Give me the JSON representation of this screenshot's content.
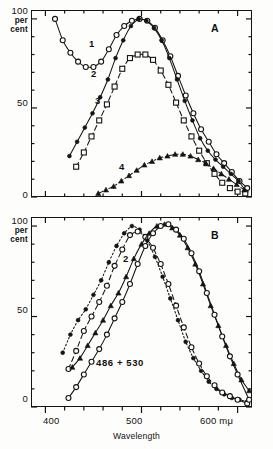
{
  "figure": {
    "width": 273,
    "height": 449,
    "background": "#fdfdfc",
    "ink": "#141414"
  },
  "axis": {
    "x_title": "Wavelength",
    "x_unit": "mμ",
    "x_ticks_major": [
      400,
      500,
      600
    ],
    "x_tick_labels": [
      "400",
      "500",
      "600 mμ"
    ],
    "x_minor_step": 20,
    "x_range": [
      385,
      615
    ],
    "y_ticks_major": [
      0,
      50,
      100
    ],
    "y_tick_labels": [
      "0",
      "50",
      "100"
    ],
    "y_unit_line1": "per",
    "y_unit_line2": "cent",
    "y_minor_step": 10,
    "y_range": [
      0,
      105
    ]
  },
  "panels": [
    {
      "id": "A",
      "label": "A"
    },
    {
      "id": "B",
      "label": "B",
      "annotation": "486 + 530"
    }
  ],
  "curve_labels_a": [
    "1",
    "2",
    "3",
    "4"
  ],
  "curve_labels_b": [
    "2"
  ],
  "chart_data": {
    "type": "line",
    "title": "",
    "xlabel": "Wavelength",
    "ylabel": "per cent",
    "xlim": [
      385,
      615
    ],
    "ylim": [
      0,
      105
    ],
    "grid": false,
    "legend": "none",
    "panels": [
      {
        "id": "A",
        "label": "A",
        "series": [
          {
            "name": "1",
            "marker": "open-circle",
            "line": "solid",
            "x": [
              410,
              418,
              426,
              434,
              442,
              450,
              458,
              466,
              474,
              482,
              490,
              498,
              506,
              514,
              522,
              530,
              538,
              546,
              554,
              562,
              570,
              578,
              586,
              594,
              602,
              610
            ],
            "y": [
              100,
              88,
              81,
              76,
              73,
              73,
              76,
              83,
              91,
              96,
              99,
              100,
              99,
              95,
              88,
              79,
              68,
              57,
              47,
              38,
              31,
              24,
              19,
              14,
              9,
              5
            ]
          },
          {
            "name": "2",
            "marker": "filled-circle",
            "line": "solid",
            "x": [
              425,
              433,
              441,
              449,
              457,
              465,
              473,
              481,
              489,
              497,
              505,
              513,
              521,
              529,
              537,
              545,
              553,
              561,
              569,
              577,
              585,
              593,
              601,
              609
            ],
            "y": [
              23,
              31,
              39,
              47,
              56,
              66,
              78,
              88,
              96,
              100,
              99,
              95,
              88,
              78,
              66,
              54,
              43,
              33,
              26,
              21,
              17,
              13,
              9,
              3
            ]
          },
          {
            "name": "3",
            "marker": "open-square",
            "line": "dashed",
            "x": [
              432,
              440,
              448,
              456,
              464,
              472,
              480,
              488,
              496,
              504,
              512,
              520,
              528,
              536,
              544,
              552,
              560,
              568,
              576,
              584,
              592,
              600,
              608
            ],
            "y": [
              17,
              25,
              34,
              43,
              52,
              62,
              72,
              78,
              80,
              80,
              77,
              71,
              63,
              53,
              43,
              34,
              26,
              19,
              13,
              8,
              5,
              3,
              2
            ]
          },
          {
            "name": "4",
            "marker": "filled-triangle",
            "line": "dash-dot",
            "x": [
              455,
              463,
              471,
              479,
              487,
              495,
              503,
              511,
              519,
              527,
              535,
              543,
              551,
              559,
              567,
              575,
              583,
              591,
              599,
              607
            ],
            "y": [
              2,
              4,
              6,
              9,
              12,
              15,
              18,
              20,
              22,
              23,
              24,
              24,
              23,
              21,
              19,
              16,
              13,
              10,
              7,
              4
            ]
          }
        ]
      },
      {
        "id": "B",
        "label": "B",
        "annotation": "486 + 530",
        "series": [
          {
            "name": "486-filled",
            "marker": "filled-circle",
            "line": "dotted",
            "x": [
              418,
              426,
              434,
              442,
              450,
              458,
              466,
              474,
              482,
              490,
              498,
              506,
              514,
              522,
              530,
              538,
              546,
              554,
              562,
              570,
              578,
              586,
              594,
              602,
              610
            ],
            "y": [
              30,
              40,
              48,
              54,
              62,
              70,
              80,
              89,
              96,
              100,
              98,
              92,
              83,
              72,
              60,
              48,
              36,
              27,
              20,
              14,
              10,
              7,
              5,
              4,
              3
            ]
          },
          {
            "name": "486-open",
            "marker": "open-circle",
            "line": "dashed",
            "x": [
              424,
              432,
              440,
              448,
              456,
              464,
              472,
              480,
              488,
              496,
              504,
              512,
              520,
              528,
              536,
              544,
              552,
              560,
              568,
              576,
              584,
              592,
              600,
              610
            ],
            "y": [
              21,
              31,
              42,
              50,
              58,
              67,
              78,
              87,
              95,
              97,
              94,
              88,
              79,
              68,
              56,
              44,
              33,
              24,
              17,
              12,
              8,
              6,
              4,
              2
            ]
          },
          {
            "name": "530-filled",
            "marker": "filled-triangle",
            "line": "solid",
            "x": [
              428,
              436,
              444,
              452,
              460,
              468,
              476,
              484,
              492,
              500,
              508,
              516,
              524,
              532,
              540,
              548,
              556,
              564,
              572,
              580,
              588,
              596,
              604,
              612
            ],
            "y": [
              22,
              27,
              34,
              41,
              48,
              56,
              63,
              72,
              82,
              90,
              96,
              100,
              101,
              99,
              95,
              88,
              79,
              68,
              56,
              45,
              34,
              24,
              15,
              9
            ]
          },
          {
            "name": "530-open",
            "marker": "open-circle",
            "line": "solid",
            "x": [
              424,
              432,
              440,
              448,
              456,
              464,
              472,
              480,
              488,
              496,
              504,
              512,
              520,
              528,
              536,
              544,
              552,
              560,
              568,
              576,
              584,
              592,
              600,
              612
            ],
            "y": [
              5,
              11,
              18,
              25,
              32,
              40,
              49,
              58,
              68,
              79,
              89,
              96,
              100,
              101,
              98,
              93,
              85,
              75,
              63,
              51,
              39,
              28,
              18,
              4
            ]
          }
        ]
      }
    ]
  }
}
